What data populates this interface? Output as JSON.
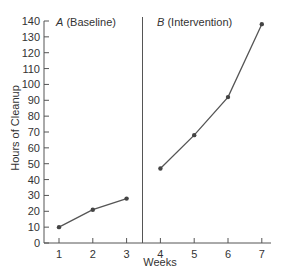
{
  "chart_data": {
    "type": "line",
    "title": "",
    "xlabel": "Weeks",
    "ylabel": "Hours of Cleanup",
    "ylim": [
      0,
      140
    ],
    "xlim": [
      1,
      7
    ],
    "y_ticks": [
      0,
      10,
      20,
      30,
      40,
      50,
      60,
      70,
      80,
      90,
      100,
      110,
      120,
      130,
      140
    ],
    "x_ticks": [
      1,
      2,
      3,
      4,
      5,
      6,
      7
    ],
    "grid": false,
    "legend": null,
    "phase_change_line_between_weeks": [
      3,
      4
    ],
    "series": [
      {
        "name": "A (Baseline)",
        "phase_letter": "A",
        "phase_name": "(Baseline)",
        "x": [
          1,
          2,
          3
        ],
        "values": [
          10,
          21,
          28
        ]
      },
      {
        "name": "B (Intervention)",
        "phase_letter": "B",
        "phase_name": "(Intervention)",
        "x": [
          4,
          5,
          6,
          7
        ],
        "values": [
          47,
          68,
          92,
          138
        ]
      }
    ],
    "annotations": [
      "A (Baseline)",
      "B (Intervention)"
    ],
    "colors": {
      "line": "#555555",
      "marker": "#444444",
      "axis": "#555555",
      "text": "#333333"
    }
  }
}
